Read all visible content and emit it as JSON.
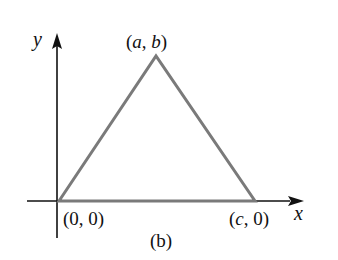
{
  "figure": {
    "caption": "(b)",
    "axes": {
      "x_label": "x",
      "y_label": "y",
      "color": "#111111"
    },
    "triangle": {
      "stroke_color": "#7a7a7a",
      "vertices": [
        {
          "name": "origin",
          "label": "(0, 0)"
        },
        {
          "name": "apex",
          "label": "(a, b)"
        },
        {
          "name": "right",
          "label": "(c, 0)"
        }
      ]
    },
    "labels": {
      "apex_open": "(",
      "apex_a": "a",
      "apex_comma": ", ",
      "apex_b": "b",
      "apex_close": ")",
      "origin": "(0, 0)",
      "right_open": "(",
      "right_c": "c",
      "right_rest": ", 0)"
    }
  }
}
